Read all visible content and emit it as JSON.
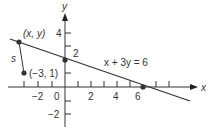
{
  "diagram": {
    "axes": {
      "x_label": "x",
      "y_label": "y",
      "x_ticks": [
        {
          "value": -2,
          "label": "−2"
        },
        {
          "value": 0,
          "label": "0"
        },
        {
          "value": 2,
          "label": "2"
        },
        {
          "value": 4,
          "label": "4"
        },
        {
          "value": 6,
          "label": "6"
        }
      ],
      "y_ticks": [
        {
          "value": 4,
          "label": "4"
        },
        {
          "value": 2,
          "label": "2"
        },
        {
          "value": -2,
          "label": "−2"
        }
      ]
    },
    "line": {
      "equation": "x + 3y = 6",
      "x_intercept": 6,
      "y_intercept": 2
    },
    "points": [
      {
        "name": "moving-point",
        "label": "(x, y)"
      },
      {
        "name": "fixed-point",
        "label": "(−3, 1)"
      }
    ],
    "segment_label": "s",
    "colors": {
      "stroke": "#333333",
      "background": "#ffffff"
    }
  }
}
